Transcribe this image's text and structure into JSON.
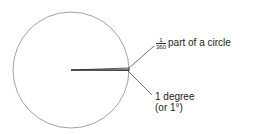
{
  "diagram": {
    "circle": {
      "cx": 71,
      "cy": 70,
      "r": 58,
      "stroke": "#8a8a8a"
    },
    "wedge": {
      "angle_degrees": 1,
      "stroke": "#333333"
    },
    "labels": {
      "fraction_numerator": "1",
      "fraction_denominator": "360",
      "fraction_text": "part of a circle",
      "degree_line1": "1 degree",
      "degree_line2": "(or 1°)"
    }
  }
}
